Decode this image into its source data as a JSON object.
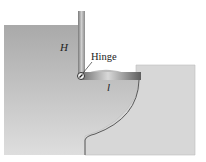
{
  "diagram": {
    "labels": {
      "height": "H",
      "hinge": "Hinge",
      "length": "l"
    },
    "colors": {
      "background": "#ffffff",
      "water_left_top": "#a8a8a8",
      "water_left_bottom": "#dcdcdc",
      "right_block": "#d6d6d6",
      "gate_dark": "#6e6e6e",
      "gate_light": "#c8c8c8",
      "curve_stroke": "#555555"
    }
  }
}
